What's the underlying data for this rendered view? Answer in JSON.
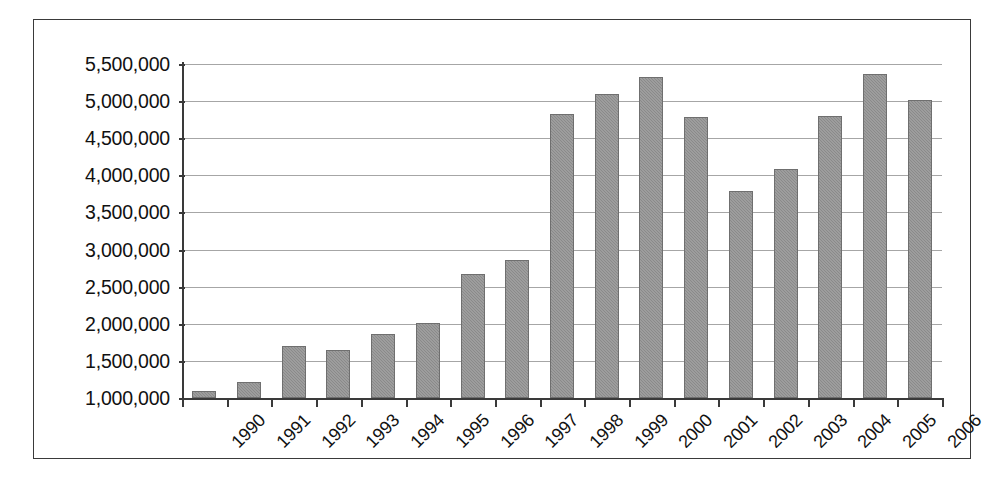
{
  "chart_data": {
    "type": "bar",
    "title": "",
    "subtitle": "",
    "xlabel": "",
    "ylabel": "",
    "categories": [
      "1990",
      "1991",
      "1992",
      "1993",
      "1994",
      "1995",
      "1996",
      "1997",
      "1998",
      "1999",
      "2000",
      "2001",
      "2002",
      "2003",
      "2004",
      "2005",
      "2006"
    ],
    "values": [
      1090000,
      1220000,
      1700000,
      1650000,
      1860000,
      2010000,
      2670000,
      2860000,
      4820000,
      5100000,
      5320000,
      4780000,
      3790000,
      4080000,
      4800000,
      5360000,
      5020000
    ],
    "series": [
      {
        "name": "",
        "values": [
          1090000,
          1220000,
          1700000,
          1650000,
          1860000,
          2010000,
          2670000,
          2860000,
          4820000,
          5100000,
          5320000,
          4780000,
          3790000,
          4080000,
          4800000,
          5360000,
          5020000
        ]
      }
    ],
    "ylim": [
      1000000,
      5500000
    ],
    "ytick_values": [
      5500000,
      5000000,
      4500000,
      4000000,
      3500000,
      3000000,
      2500000,
      2000000,
      1500000,
      1000000
    ],
    "ytick_labels": [
      "5,500,000",
      "5,000,000",
      "4,500,000",
      "4,000,000",
      "3,500,000",
      "3,000,000",
      "2,500,000",
      "2,000,000",
      "1,500,000",
      "1,000,000"
    ],
    "grid": "horizontal",
    "legend": "none",
    "bar_color": "#8a8a8a",
    "bar_border_color": "#6f6f6f",
    "axis_color": "#3a3a3a",
    "gridline_color": "#a6a6a6",
    "plot_background": "#ffffff",
    "xtick_label_rotation": "-45",
    "annotations": []
  }
}
